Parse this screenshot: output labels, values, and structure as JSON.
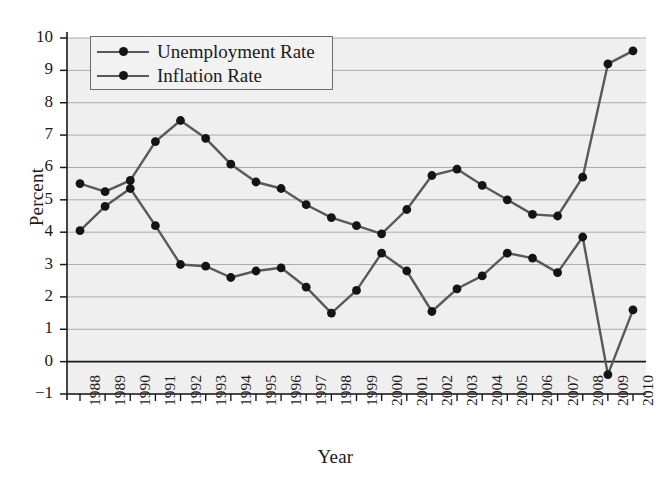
{
  "chart_data": {
    "type": "line",
    "title": "",
    "xlabel": "Year",
    "ylabel": "Percent",
    "categories": [
      "1988",
      "1989",
      "1990",
      "1991",
      "1992",
      "1993",
      "1994",
      "1995",
      "1996",
      "1997",
      "1998",
      "1999",
      "2000",
      "2001",
      "2002",
      "2003",
      "2004",
      "2005",
      "2006",
      "2007",
      "2008",
      "2009",
      "2010"
    ],
    "series": [
      {
        "name": "Unemployment Rate",
        "color": "#595959",
        "marker_color": "#141414",
        "values": [
          5.5,
          5.25,
          5.6,
          6.8,
          7.45,
          6.9,
          6.1,
          5.55,
          5.35,
          4.85,
          4.45,
          4.2,
          3.95,
          4.7,
          5.75,
          5.95,
          5.45,
          5.0,
          4.55,
          4.5,
          5.7,
          9.2,
          9.6
        ]
      },
      {
        "name": "Inflation Rate",
        "color": "#595959",
        "marker_color": "#141414",
        "values": [
          4.05,
          4.8,
          5.35,
          4.2,
          3.0,
          2.95,
          2.6,
          2.8,
          2.9,
          2.3,
          1.5,
          2.2,
          3.35,
          2.8,
          1.55,
          2.25,
          2.65,
          3.35,
          3.2,
          2.75,
          3.85,
          -0.4,
          1.6
        ]
      }
    ],
    "ylim": [
      -1,
      10
    ],
    "yticks": [
      "10",
      "9",
      "8",
      "7",
      "6",
      "5",
      "4",
      "3",
      "2",
      "1",
      "0",
      "-1"
    ],
    "ytick_values": [
      10,
      9,
      8,
      7,
      6,
      5,
      4,
      3,
      2,
      1,
      0,
      -1
    ],
    "grid": true,
    "grid_color": "#9a9a9a",
    "zero_line_color": "#1a1a1a",
    "plot_background": "#efefef",
    "legend_position": "top-left"
  },
  "legend": {
    "entries": [
      {
        "label": "Unemployment Rate"
      },
      {
        "label": "Inflation Rate"
      }
    ]
  }
}
